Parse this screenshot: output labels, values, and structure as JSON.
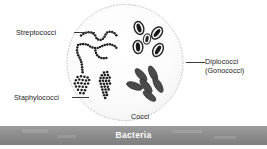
{
  "figure": {
    "title": "Bacteria",
    "banner_label": "Bacteria",
    "background_color": "#ffffff",
    "banner_color": "#8f8f8f",
    "banner_text_color": "#ffffff",
    "ink_color": "#1c1c1c",
    "dish_outline_color": "#b4b4b4",
    "dish_fill_color": "#fcfcfc"
  },
  "labels": {
    "streptococci": "Streptococci",
    "staphylococci": "Staphylococci",
    "diplococci": "Diplococci\n(Gonococci)",
    "diplococci_line1": "Diplococci",
    "diplococci_line2": "(Gonococci)",
    "cocci": "Cocci"
  },
  "groups": [
    {
      "name": "streptococci",
      "label": "Streptococci",
      "description": "chains of cocci",
      "morphology": "chain",
      "position": "upper-left"
    },
    {
      "name": "diplococci",
      "label": "Diplococci (Gonococci)",
      "description": "paired kidney-shaped cocci",
      "morphology": "pairs",
      "count": 5,
      "position": "upper-right"
    },
    {
      "name": "staphylococci",
      "label": "Staphylococci",
      "description": "grape-like clusters of cocci",
      "morphology": "cluster",
      "count": 2,
      "position": "lower-left"
    },
    {
      "name": "cocci",
      "label": "Cocci",
      "description": "solid oval cells in a rosette",
      "morphology": "oval",
      "count": 6,
      "position": "lower-right"
    }
  ]
}
